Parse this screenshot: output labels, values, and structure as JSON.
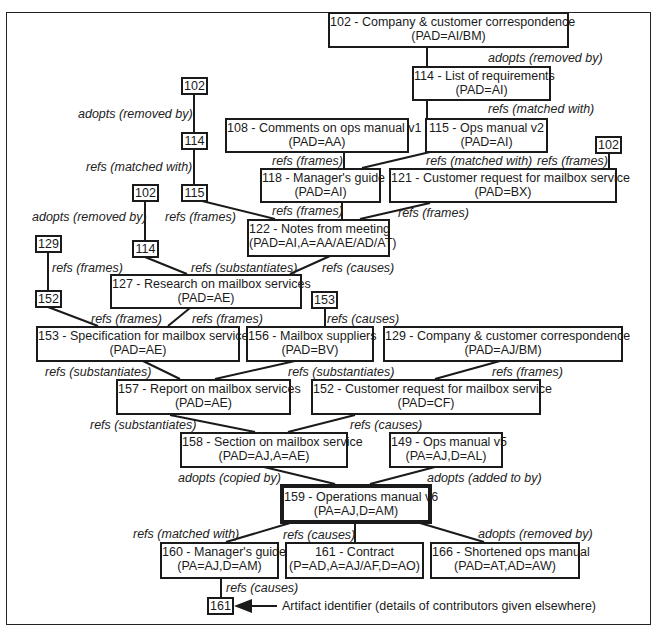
{
  "diagram": {
    "type": "artifact-relationship-tree",
    "nodes": [
      {
        "id": "102",
        "title": "102 - Company & customer correspondence",
        "pad": "(PAD=AI/BM)"
      },
      {
        "id": "114",
        "title": "114 - List of requirements",
        "pad": "(PAD=AI)"
      },
      {
        "id": "108",
        "title": "108 - Comments on ops manual v1",
        "pad": "(PAD=AA)"
      },
      {
        "id": "115",
        "title": "115 - Ops manual v2",
        "pad": "(PAD=AI)"
      },
      {
        "id": "118",
        "title": "118 - Manager's guide",
        "pad": "(PAD=AI)"
      },
      {
        "id": "121",
        "title": "121 - Customer request for mailbox service",
        "pad": "(PAD=BX)"
      },
      {
        "id": "122",
        "title": "122 - Notes from meeting",
        "pad": "(PAD=AI,A=AA/AE/AD/AT)"
      },
      {
        "id": "127",
        "title": "127 - Research on mailbox services",
        "pad": "(PAD=AE)"
      },
      {
        "id": "153",
        "title": "153 - Specification for mailbox service",
        "pad": "(PAD=AE)"
      },
      {
        "id": "156",
        "title": "156 - Mailbox suppliers",
        "pad": "(PAD=BV)"
      },
      {
        "id": "129",
        "title": "129 - Company & customer correspondence",
        "pad": "(PAD=AJ/BM)"
      },
      {
        "id": "157",
        "title": "157 - Report on mailbox services",
        "pad": "(PAD=AE)"
      },
      {
        "id": "152",
        "title": "152 - Customer request for mailbox service",
        "pad": "(PAD=CF)"
      },
      {
        "id": "158",
        "title": "158 - Section on mailbox service",
        "pad": "(PAD=AJ,A=AE)"
      },
      {
        "id": "149",
        "title": "149 - Ops manual v5",
        "pad": "(PA=AJ,D=AL)"
      },
      {
        "id": "159",
        "title": "159 - Operations manual v6",
        "pad": "(PA=AJ,D=AM)"
      },
      {
        "id": "160",
        "title": "160 - Manager's guide",
        "pad": "(PA=AJ,D=AM)"
      },
      {
        "id": "161",
        "title": "161 - Contract",
        "pad": "(P=AD,A=AJ/AF,D=AO)"
      },
      {
        "id": "166",
        "title": "166 - Shortened ops manual",
        "pad": "(PAD=AT,AD=AW)"
      }
    ],
    "refs": [
      {
        "key": "r102a",
        "label": "102"
      },
      {
        "key": "r114a",
        "label": "114"
      },
      {
        "key": "r115a",
        "label": "115"
      },
      {
        "key": "r102b",
        "label": "102"
      },
      {
        "key": "r114b",
        "label": "114"
      },
      {
        "key": "r129",
        "label": "129"
      },
      {
        "key": "r152",
        "label": "152"
      },
      {
        "key": "r153",
        "label": "153"
      },
      {
        "key": "r102c",
        "label": "102"
      },
      {
        "key": "r161",
        "label": "161"
      }
    ],
    "labels": [
      "adopts (removed by)",
      "refs (matched with)",
      "refs (frames)",
      "refs (matched with)",
      "refs (frames)",
      "refs (frames)",
      "refs (frames)",
      "adopts (removed by)",
      "refs (matched with)",
      "refs (frames)",
      "adopts (removed by)",
      "refs (frames)",
      "refs (substantiates)",
      "refs (causes)",
      "refs (frames)",
      "refs (frames)",
      "refs (causes)",
      "refs (substantiates)",
      "refs (substantiates)",
      "refs (frames)",
      "refs (substantiates)",
      "refs (causes)",
      "adopts (copied by)",
      "adopts (added to by)",
      "refs (matched with)",
      "refs (causes)",
      "adopts (removed by)",
      "refs (causes)"
    ],
    "legend": {
      "text": "Artifact identifier (details of contributors given elsewhere)"
    }
  }
}
